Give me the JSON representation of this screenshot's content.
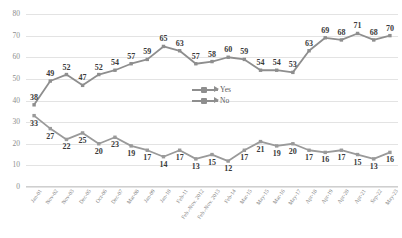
{
  "chart_data": {
    "type": "line",
    "title": "",
    "xlabel": "",
    "ylabel": "",
    "ylim": [
      0,
      80
    ],
    "yticks": [
      0,
      10,
      20,
      30,
      40,
      50,
      60,
      70,
      80
    ],
    "grid": true,
    "legend_position": "center",
    "categories": [
      "Jan-01",
      "Nov-02",
      "Nov-03",
      "Dec-05",
      "Oct-06",
      "Dec-07",
      "Mar-08",
      "Jan-09",
      "Jan-10",
      "Feb-11",
      "Feb.-Nov. 2012",
      "Feb.-Nov. 2013",
      "Feb-14",
      "Mar-15",
      "May-15",
      "Mar-16",
      "May-17",
      "Apr-18",
      "Apr-19",
      "Apr-20",
      "Apr-21",
      "Sep-22",
      "May-23"
    ],
    "series": [
      {
        "name": "Yes",
        "color": "#8e8e8e",
        "values": [
          38,
          49,
          52,
          47,
          52,
          54,
          57,
          59,
          65,
          63,
          57,
          58,
          60,
          59,
          54,
          54,
          53,
          63,
          69,
          68,
          71,
          68,
          70
        ]
      },
      {
        "name": "No",
        "color": "#9a9a9a",
        "values": [
          33,
          27,
          22,
          25,
          20,
          23,
          19,
          17,
          14,
          17,
          13,
          15,
          12,
          17,
          21,
          19,
          20,
          17,
          16,
          17,
          15,
          13,
          16
        ]
      }
    ]
  },
  "legend": {
    "items": [
      {
        "label": "Yes"
      },
      {
        "label": "No"
      }
    ]
  }
}
